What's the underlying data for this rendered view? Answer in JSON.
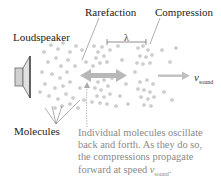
{
  "labels": {
    "loudspeaker": "Loudspeaker",
    "rarefaction": "Rarefaction",
    "compression": "Compression",
    "lambda": "λ",
    "molecules": "Molecules",
    "v": "v",
    "v_sub": "sound"
  },
  "caption": {
    "line1": "Individual molecules oscillate",
    "line2": "back and forth. As they do so,",
    "line3": "the compressions propagate",
    "line4_prefix": "forward at speed ",
    "line4_v": "v",
    "line4_sub": "sound",
    "line4_suffix": "."
  },
  "colors": {
    "molecule": "#c8c8c8",
    "arrow": "#b5b5b5",
    "speaker": "#9a9a9a",
    "caption": "#8a8a8a"
  },
  "icons": {
    "speaker": "loudspeaker-icon",
    "double_arrow": "oscillation-double-arrow-icon",
    "right_arrow": "propagation-arrow-icon"
  }
}
